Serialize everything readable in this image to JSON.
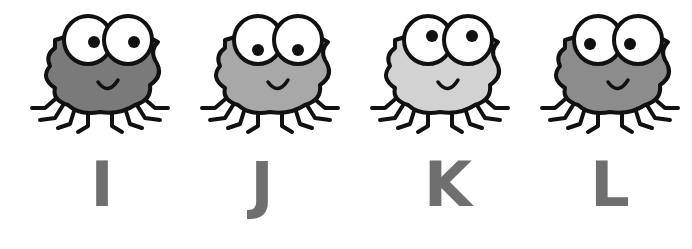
{
  "worksheet": {
    "items": [
      {
        "letter": "I",
        "body_color": "#7a7a7a",
        "pupil_dir": "right",
        "x": 10,
        "letter_x": 62
      },
      {
        "letter": "J",
        "body_color": "#a8a8a8",
        "pupil_dir": "down",
        "x": 180,
        "letter_x": 222
      },
      {
        "letter": "K",
        "body_color": "#d2d2d2",
        "pupil_dir": "up",
        "x": 350,
        "letter_x": 408
      },
      {
        "letter": "L",
        "body_color": "#8c8c8c",
        "pupil_dir": "left",
        "x": 520,
        "letter_x": 570
      }
    ],
    "letter_color": "#6f6f6f",
    "outline_color": "#111111"
  }
}
